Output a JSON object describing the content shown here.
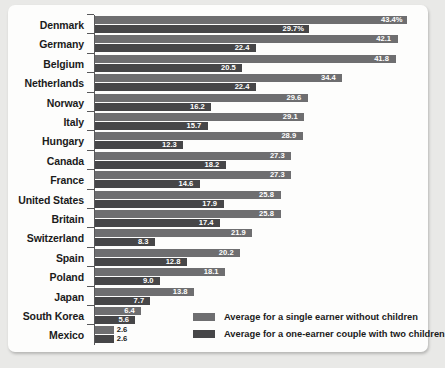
{
  "chart_data": {
    "type": "bar",
    "orientation": "horizontal",
    "title": "",
    "xlabel": "",
    "ylabel": "",
    "xlim": [
      0,
      43.4
    ],
    "grid": false,
    "legend_position": "bottom-right",
    "categories": [
      "Denmark",
      "Germany",
      "Belgium",
      "Netherlands",
      "Norway",
      "Italy",
      "Hungary",
      "Canada",
      "France",
      "United States",
      "Britain",
      "Switzerland",
      "Spain",
      "Poland",
      "Japan",
      "South Korea",
      "Mexico"
    ],
    "series": [
      {
        "name": "Average for a single earner without children",
        "color": "#6e6e70",
        "values": [
          43.4,
          42.1,
          41.8,
          34.4,
          29.6,
          29.1,
          28.9,
          27.3,
          27.3,
          25.8,
          25.8,
          21.9,
          20.2,
          18.1,
          13.8,
          6.4,
          2.6
        ],
        "labels": [
          "43.4%",
          "42.1",
          "41.8",
          "34.4",
          "29.6",
          "29.1",
          "28.9",
          "27.3",
          "27.3",
          "25.8",
          "25.8",
          "21.9",
          "20.2",
          "18.1",
          "13.8",
          "6.4",
          "2.6"
        ]
      },
      {
        "name": "Average for a one-earner couple with two children",
        "color": "#464648",
        "values": [
          29.7,
          22.4,
          20.5,
          22.4,
          16.2,
          15.7,
          12.3,
          18.2,
          14.6,
          17.9,
          17.4,
          8.3,
          12.8,
          9.0,
          7.7,
          5.6,
          2.6
        ],
        "labels": [
          "29.7%",
          "22.4",
          "20.5",
          "22.4",
          "16.2",
          "15.7",
          "12.3",
          "18.2",
          "14.6",
          "17.9",
          "17.4",
          "8.3",
          "12.8",
          "9.0",
          "7.7",
          "5.6",
          "2.6"
        ]
      }
    ]
  },
  "legend": {
    "items": [
      {
        "label": "Average for a single earner without children",
        "swatch": "single"
      },
      {
        "label": "Average for a one-earner couple with two children",
        "swatch": "couple"
      }
    ]
  }
}
